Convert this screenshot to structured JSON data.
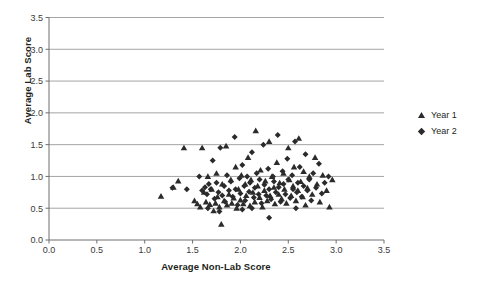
{
  "chart_data": {
    "type": "scatter",
    "title": "",
    "xlabel": "Average Non-Lab Score",
    "ylabel": "Average Lab Score",
    "xlim": [
      0.0,
      3.5
    ],
    "ylim": [
      0.0,
      3.5
    ],
    "xticks": [
      "0.0",
      "0.5",
      "1.0",
      "1.5",
      "2.0",
      "2.5",
      "3.0",
      "3.5"
    ],
    "yticks": [
      "0.0",
      "0.5",
      "1.0",
      "1.5",
      "2.0",
      "2.5",
      "3.0",
      "3.5"
    ],
    "xtick_values": [
      0.0,
      0.5,
      1.0,
      1.5,
      2.0,
      2.5,
      3.0,
      3.5
    ],
    "ytick_values": [
      0.0,
      0.5,
      1.0,
      1.5,
      2.0,
      2.5,
      3.0,
      3.5
    ],
    "grid": "horizontal",
    "legend_position": "right",
    "marker_color": "#2b2b2b",
    "gridline_color": "#9a9a9a",
    "series": [
      {
        "name": "Year 1",
        "marker": "triangle",
        "color": "#2b2b2b",
        "points": [
          [
            1.17,
            0.69
          ],
          [
            1.3,
            0.83
          ],
          [
            1.35,
            0.93
          ],
          [
            1.41,
            1.45
          ],
          [
            1.52,
            0.62
          ],
          [
            1.55,
            0.57
          ],
          [
            1.58,
            0.52
          ],
          [
            1.6,
            1.45
          ],
          [
            1.62,
            0.75
          ],
          [
            1.64,
            0.6
          ],
          [
            1.66,
            1.0
          ],
          [
            1.68,
            0.56
          ],
          [
            1.7,
            0.8
          ],
          [
            1.72,
            0.46
          ],
          [
            1.74,
            0.58
          ],
          [
            1.75,
            1.05
          ],
          [
            1.76,
            0.68
          ],
          [
            1.78,
            0.52
          ],
          [
            1.8,
            0.25
          ],
          [
            1.81,
            0.88
          ],
          [
            1.83,
            0.62
          ],
          [
            1.85,
            1.48
          ],
          [
            1.86,
            0.55
          ],
          [
            1.88,
            0.72
          ],
          [
            1.9,
            0.95
          ],
          [
            1.91,
            0.58
          ],
          [
            1.93,
            0.66
          ],
          [
            1.95,
            1.15
          ],
          [
            1.96,
            0.5
          ],
          [
            1.98,
            0.8
          ],
          [
            2.0,
            0.63
          ],
          [
            2.01,
            1.02
          ],
          [
            2.03,
            0.57
          ],
          [
            2.05,
            0.88
          ],
          [
            2.06,
            0.7
          ],
          [
            2.08,
            1.3
          ],
          [
            2.1,
            0.54
          ],
          [
            2.11,
            0.95
          ],
          [
            2.13,
            0.75
          ],
          [
            2.15,
            0.6
          ],
          [
            2.16,
            1.72
          ],
          [
            2.18,
            0.85
          ],
          [
            2.2,
            0.67
          ],
          [
            2.21,
            1.1
          ],
          [
            2.23,
            0.52
          ],
          [
            2.25,
            0.78
          ],
          [
            2.26,
            0.93
          ],
          [
            2.28,
            0.62
          ],
          [
            2.3,
            1.55
          ],
          [
            2.31,
            0.7
          ],
          [
            2.33,
            1.0
          ],
          [
            2.35,
            0.83
          ],
          [
            2.36,
            0.57
          ],
          [
            2.38,
            1.22
          ],
          [
            2.4,
            0.72
          ],
          [
            2.41,
            0.9
          ],
          [
            2.43,
            0.65
          ],
          [
            2.45,
            1.05
          ],
          [
            2.46,
            0.8
          ],
          [
            2.48,
            0.58
          ],
          [
            2.5,
            1.45
          ],
          [
            2.51,
            0.95
          ],
          [
            2.53,
            0.7
          ],
          [
            2.55,
            0.85
          ],
          [
            2.56,
            1.15
          ],
          [
            2.58,
            0.62
          ],
          [
            2.6,
            0.78
          ],
          [
            2.61,
            1.6
          ],
          [
            2.63,
            0.92
          ],
          [
            2.65,
            0.68
          ],
          [
            2.66,
            1.08
          ],
          [
            2.68,
            0.55
          ],
          [
            2.7,
            0.82
          ],
          [
            2.72,
            1.0
          ],
          [
            2.75,
            0.72
          ],
          [
            2.78,
            1.3
          ],
          [
            2.8,
            0.88
          ],
          [
            2.83,
            0.6
          ],
          [
            2.86,
            1.02
          ],
          [
            2.9,
            0.78
          ],
          [
            2.93,
            0.52
          ],
          [
            2.96,
            0.95
          ]
        ]
      },
      {
        "name": "Year 2",
        "marker": "diamond",
        "color": "#2b2b2b",
        "points": [
          [
            1.29,
            0.82
          ],
          [
            1.44,
            0.8
          ],
          [
            1.57,
            1.0
          ],
          [
            1.6,
            0.78
          ],
          [
            1.63,
            0.83
          ],
          [
            1.65,
            0.72
          ],
          [
            1.67,
            0.88
          ],
          [
            1.69,
            0.8
          ],
          [
            1.71,
            1.25
          ],
          [
            1.73,
            0.65
          ],
          [
            1.75,
            0.9
          ],
          [
            1.77,
            0.75
          ],
          [
            1.79,
            1.45
          ],
          [
            1.81,
            0.7
          ],
          [
            1.83,
            0.85
          ],
          [
            1.84,
            0.6
          ],
          [
            1.86,
            1.02
          ],
          [
            1.88,
            0.78
          ],
          [
            1.9,
            0.92
          ],
          [
            1.92,
            0.68
          ],
          [
            1.94,
            1.62
          ],
          [
            1.95,
            0.8
          ],
          [
            1.97,
            0.55
          ],
          [
            1.99,
            0.97
          ],
          [
            2.0,
            0.73
          ],
          [
            2.02,
            1.18
          ],
          [
            2.04,
            0.85
          ],
          [
            2.05,
            0.62
          ],
          [
            2.07,
            1.0
          ],
          [
            2.09,
            0.76
          ],
          [
            2.1,
            0.9
          ],
          [
            2.12,
            1.38
          ],
          [
            2.14,
            0.67
          ],
          [
            2.15,
            0.82
          ],
          [
            2.17,
            1.05
          ],
          [
            2.19,
            0.72
          ],
          [
            2.2,
            0.95
          ],
          [
            2.22,
            0.58
          ],
          [
            2.24,
            1.5
          ],
          [
            2.25,
            0.87
          ],
          [
            2.27,
            0.7
          ],
          [
            2.29,
            1.12
          ],
          [
            2.3,
            0.8
          ],
          [
            2.32,
            0.64
          ],
          [
            2.34,
            1.0
          ],
          [
            2.35,
            0.92
          ],
          [
            2.37,
            0.75
          ],
          [
            2.39,
            1.65
          ],
          [
            2.4,
            0.83
          ],
          [
            2.42,
            0.6
          ],
          [
            2.44,
            1.08
          ],
          [
            2.45,
            0.88
          ],
          [
            2.47,
            0.72
          ],
          [
            2.49,
            1.28
          ],
          [
            2.5,
            0.95
          ],
          [
            2.52,
            0.66
          ],
          [
            2.54,
            1.02
          ],
          [
            2.55,
            0.8
          ],
          [
            2.57,
            1.55
          ],
          [
            2.59,
            0.75
          ],
          [
            2.6,
            0.9
          ],
          [
            2.62,
            1.15
          ],
          [
            2.64,
            0.68
          ],
          [
            2.66,
            0.85
          ],
          [
            2.68,
            1.35
          ],
          [
            2.7,
            0.78
          ],
          [
            2.72,
            0.95
          ],
          [
            2.74,
            0.62
          ],
          [
            2.76,
            1.05
          ],
          [
            2.79,
            0.82
          ],
          [
            2.82,
            1.2
          ],
          [
            2.85,
            0.73
          ],
          [
            2.88,
            0.9
          ],
          [
            2.92,
            1.0
          ],
          [
            2.3,
            0.35
          ],
          [
            2.02,
            0.48
          ],
          [
            1.78,
            0.45
          ],
          [
            2.58,
            0.5
          ],
          [
            2.12,
            0.5
          ],
          [
            1.66,
            0.5
          ]
        ]
      }
    ]
  },
  "legend": {
    "items": [
      {
        "label": "Year 1",
        "marker": "triangle"
      },
      {
        "label": "Year 2",
        "marker": "diamond"
      }
    ]
  }
}
